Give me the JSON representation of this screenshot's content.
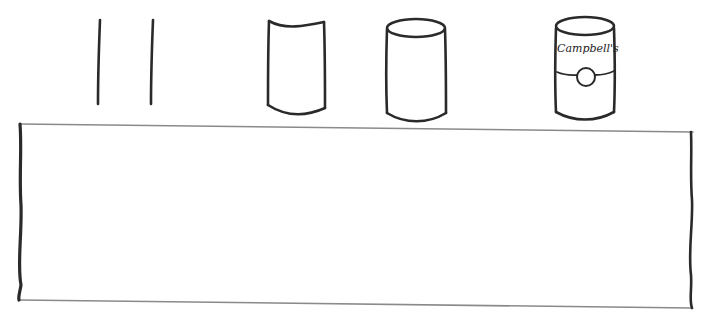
{
  "figure": {
    "steps": [
      {
        "id": "step-1",
        "shape": "two-parallel-lines"
      },
      {
        "id": "step-2",
        "shape": "curved-cylinder-outline"
      },
      {
        "id": "step-3",
        "shape": "cylinder-with-ellipse-top"
      },
      {
        "id": "step-4",
        "shape": "soup-can-with-label",
        "label_text": "Campbell's"
      }
    ],
    "drawing_box": {
      "content": ""
    },
    "colors": {
      "ink": "#2a2a2a",
      "box_edge": "#8a8a8a",
      "background": "#ffffff"
    }
  }
}
